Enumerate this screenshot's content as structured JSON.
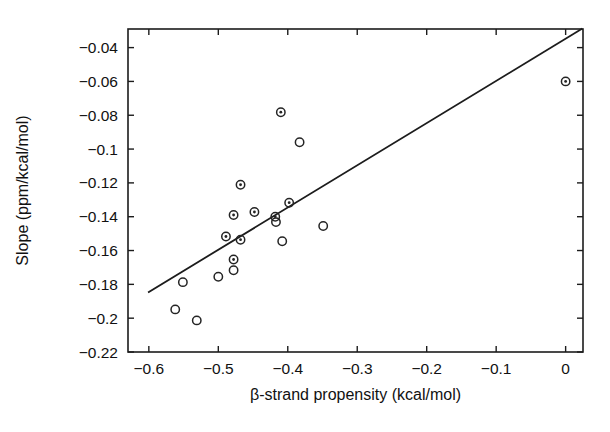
{
  "chart_data": {
    "type": "scatter",
    "title": "",
    "xlabel": "β-strand propensity (kcal/mol)",
    "ylabel": "Slope (ppm/kcal/mol)",
    "xlim": [
      -0.63,
      0.025
    ],
    "ylim": [
      -0.22,
      -0.029
    ],
    "xticks": [
      -0.6,
      -0.5,
      -0.4,
      -0.3,
      -0.2,
      -0.1,
      0
    ],
    "xticklabels": [
      "-0.6",
      "-0.5",
      "-0.4",
      "-0.3",
      "-0.2",
      "-0.1",
      "0"
    ],
    "yticks": [
      -0.04,
      -0.06,
      -0.08,
      -0.1,
      -0.12,
      -0.14,
      -0.16,
      -0.18,
      -0.2,
      -0.22
    ],
    "yticklabels": [
      "-0.04",
      "-0.06",
      "-0.08",
      "-0.1",
      "-0.12",
      "-0.14",
      "-0.16",
      "-0.18",
      "-0.2",
      "-0.22"
    ],
    "grid": false,
    "legend": null,
    "series": [
      {
        "name": "data points",
        "marker": "circle-dot",
        "points": [
          {
            "x": -0.41,
            "y": -0.0782,
            "marker": "dot"
          },
          {
            "x": -0.383,
            "y": -0.096,
            "marker": "open"
          },
          {
            "x": -0.468,
            "y": -0.1211,
            "marker": "dot"
          },
          {
            "x": -0.478,
            "y": -0.139,
            "marker": "dot"
          },
          {
            "x": -0.448,
            "y": -0.1372,
            "marker": "dot"
          },
          {
            "x": -0.398,
            "y": -0.1317,
            "marker": "dot"
          },
          {
            "x": -0.418,
            "y": -0.14,
            "marker": "dot"
          },
          {
            "x": -0.417,
            "y": -0.1432,
            "marker": "open"
          },
          {
            "x": -0.349,
            "y": -0.1455,
            "marker": "open"
          },
          {
            "x": -0.489,
            "y": -0.1517,
            "marker": "dot"
          },
          {
            "x": -0.468,
            "y": -0.1536,
            "marker": "dot"
          },
          {
            "x": -0.408,
            "y": -0.1545,
            "marker": "open"
          },
          {
            "x": -0.478,
            "y": -0.1653,
            "marker": "dot"
          },
          {
            "x": -0.478,
            "y": -0.1717,
            "marker": "open"
          },
          {
            "x": -0.5,
            "y": -0.1755,
            "marker": "open"
          },
          {
            "x": -0.551,
            "y": -0.1787,
            "marker": "open"
          },
          {
            "x": -0.562,
            "y": -0.1948,
            "marker": "open"
          },
          {
            "x": -0.531,
            "y": -0.2013,
            "marker": "open"
          },
          {
            "x": 0.0,
            "y": -0.06,
            "marker": "dot"
          }
        ]
      }
    ],
    "fit_line": {
      "name": "linear regression",
      "x0": -0.6,
      "y0": -0.1845,
      "x1": 0.023,
      "y1": -0.029
    }
  }
}
